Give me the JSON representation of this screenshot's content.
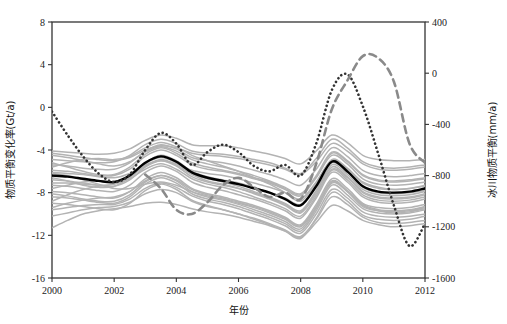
{
  "chart_data": {
    "type": "line",
    "title": "",
    "xlabel": "年份",
    "ylabel": "物质平衡变化率(Gt/a)",
    "y2label": "冰川物质平衡(mm/a)",
    "xlim": [
      2000,
      2012
    ],
    "ylim": [
      -16,
      8
    ],
    "y2lim": [
      -1600,
      400
    ],
    "xticks": [
      "2000",
      "2002",
      "2004",
      "2006",
      "2008",
      "2010",
      "2012"
    ],
    "xtick_values": [
      2000,
      2002,
      2004,
      2006,
      2008,
      2010,
      2012
    ],
    "yticks": [
      "8",
      "4",
      "0",
      "-4",
      "-8",
      "-12",
      "-16"
    ],
    "ytick_values": [
      8,
      4,
      0,
      -4,
      -8,
      -12,
      -16
    ],
    "y2ticks": [
      "400",
      "0",
      "-400",
      "-800",
      "-1200",
      "-1600"
    ],
    "y2tick_values": [
      400,
      0,
      -400,
      -800,
      -1200,
      -1600
    ],
    "grid": false,
    "legend": "none",
    "colors": {
      "ensemble_member": "#b3b3b3",
      "ensemble_mean": "#000000",
      "dotted_series": "#333333",
      "dashed_series": "#8a8a8a",
      "axis": "#333333",
      "background": "#ffffff"
    },
    "x": [
      2000,
      2000.5,
      2001,
      2001.5,
      2002,
      2002.5,
      2003,
      2003.5,
      2004,
      2004.5,
      2005,
      2005.5,
      2006,
      2006.5,
      2007,
      2007.5,
      2008,
      2008.5,
      2009,
      2009.5,
      2010,
      2010.5,
      2011,
      2011.5,
      2012
    ],
    "series": [
      {
        "name": "集合平均(黑色实线)",
        "style": "solid",
        "color": "#000000",
        "width": 2.4,
        "values": [
          -6.4,
          -6.5,
          -6.7,
          -6.9,
          -7.0,
          -6.4,
          -5.2,
          -4.6,
          -5.1,
          -6.1,
          -6.6,
          -6.9,
          -7.2,
          -7.6,
          -8.0,
          -8.6,
          -9.2,
          -7.4,
          -5.1,
          -6.0,
          -7.4,
          -7.9,
          -8.0,
          -7.9,
          -7.6
        ]
      },
      {
        "name": "点线序列(黑色点线)",
        "style": "dotted",
        "color": "#333333",
        "width": 2.0,
        "values": [
          -0.4,
          -2.6,
          -4.6,
          -6.2,
          -7.0,
          -6.3,
          -4.0,
          -2.4,
          -3.4,
          -5.4,
          -4.2,
          -3.5,
          -4.2,
          -5.5,
          -6.0,
          -5.4,
          -6.4,
          -3.4,
          1.6,
          3.1,
          0.1,
          -4.4,
          -9.2,
          -13.0,
          -10.9
        ]
      },
      {
        "name": "虚线序列(灰色虚线)",
        "style": "dashed",
        "color": "#8a8a8a",
        "width": 2.6,
        "values": [
          null,
          null,
          null,
          null,
          null,
          null,
          -6.3,
          -7.6,
          -9.6,
          -10.0,
          -8.9,
          -7.3,
          -6.6,
          -7.5,
          -8.4,
          -8.0,
          -8.6,
          -5.3,
          -0.2,
          2.5,
          4.8,
          4.6,
          2.4,
          -3.4,
          -5.2
        ]
      },
      {
        "name": "集合成员1",
        "style": "solid",
        "color": "#b3b3b3",
        "width": 1.5,
        "values": [
          -4.1,
          -4.2,
          -4.3,
          -4.4,
          -4.3,
          -3.9,
          -3.1,
          -2.6,
          -2.9,
          -3.5,
          -3.6,
          -3.6,
          -3.8,
          -4.1,
          -4.4,
          -4.8,
          -5.3,
          -4.1,
          -2.6,
          -3.3,
          -4.5,
          -4.9,
          -5.0,
          -5.0,
          -4.9
        ]
      },
      {
        "name": "集合成员2",
        "style": "solid",
        "color": "#b3b3b3",
        "width": 1.5,
        "values": [
          -4.9,
          -5.0,
          -5.1,
          -5.2,
          -5.1,
          -4.5,
          -3.5,
          -3.0,
          -3.4,
          -4.1,
          -4.3,
          -4.4,
          -4.6,
          -4.9,
          -5.2,
          -5.7,
          -6.2,
          -4.8,
          -3.0,
          -3.8,
          -5.1,
          -5.6,
          -5.7,
          -5.6,
          -5.4
        ]
      },
      {
        "name": "集合成员3",
        "style": "solid",
        "color": "#b3b3b3",
        "width": 1.5,
        "values": [
          -5.4,
          -5.5,
          -5.7,
          -5.8,
          -5.8,
          -5.2,
          -4.1,
          -3.5,
          -3.9,
          -4.7,
          -5.0,
          -5.2,
          -5.5,
          -5.9,
          -6.3,
          -6.8,
          -7.3,
          -5.8,
          -3.8,
          -4.6,
          -5.9,
          -6.4,
          -6.5,
          -6.4,
          -6.2
        ]
      },
      {
        "name": "集合成员4",
        "style": "solid",
        "color": "#b3b3b3",
        "width": 1.5,
        "values": [
          -5.9,
          -6.0,
          -6.2,
          -6.4,
          -6.4,
          -5.8,
          -4.6,
          -4.0,
          -4.5,
          -5.4,
          -5.8,
          -6.0,
          -6.3,
          -6.7,
          -7.1,
          -7.7,
          -8.3,
          -6.6,
          -4.5,
          -5.3,
          -6.7,
          -7.2,
          -7.3,
          -7.2,
          -7.0
        ]
      },
      {
        "name": "集合成员5",
        "style": "solid",
        "color": "#b3b3b3",
        "width": 1.5,
        "values": [
          -6.8,
          -6.9,
          -7.1,
          -7.3,
          -7.4,
          -6.8,
          -5.6,
          -5.0,
          -5.5,
          -6.5,
          -7.0,
          -7.3,
          -7.6,
          -8.0,
          -8.5,
          -9.1,
          -9.8,
          -7.9,
          -5.6,
          -6.5,
          -7.9,
          -8.4,
          -8.5,
          -8.4,
          -8.1
        ]
      },
      {
        "name": "集合成员6",
        "style": "solid",
        "color": "#b3b3b3",
        "width": 1.5,
        "values": [
          -7.3,
          -7.4,
          -7.6,
          -7.8,
          -7.9,
          -7.3,
          -6.1,
          -5.5,
          -6.0,
          -7.0,
          -7.5,
          -7.8,
          -8.2,
          -8.6,
          -9.1,
          -9.7,
          -10.4,
          -8.5,
          -6.1,
          -7.0,
          -8.4,
          -8.9,
          -9.0,
          -8.9,
          -8.6
        ]
      },
      {
        "name": "集合成员7",
        "style": "solid",
        "color": "#b3b3b3",
        "width": 1.5,
        "values": [
          -7.9,
          -8.0,
          -8.2,
          -8.4,
          -8.5,
          -7.9,
          -6.7,
          -6.1,
          -6.6,
          -7.6,
          -8.1,
          -8.4,
          -8.8,
          -9.2,
          -9.7,
          -10.3,
          -11.0,
          -9.1,
          -6.7,
          -7.6,
          -9.0,
          -9.4,
          -9.5,
          -9.4,
          -9.1
        ]
      },
      {
        "name": "集合成员8",
        "style": "solid",
        "color": "#b3b3b3",
        "width": 1.5,
        "values": [
          -8.4,
          -8.5,
          -8.7,
          -8.9,
          -9.0,
          -8.4,
          -7.2,
          -6.6,
          -7.1,
          -8.1,
          -8.6,
          -8.9,
          -9.3,
          -9.8,
          -10.3,
          -10.9,
          -11.6,
          -9.7,
          -7.3,
          -8.2,
          -9.5,
          -9.9,
          -10.0,
          -9.9,
          -9.6
        ]
      },
      {
        "name": "集合成员9",
        "style": "solid",
        "color": "#b3b3b3",
        "width": 1.5,
        "values": [
          -9.0,
          -9.1,
          -9.3,
          -9.5,
          -9.6,
          -9.0,
          -7.8,
          -7.2,
          -7.7,
          -8.7,
          -9.2,
          -9.6,
          -10.0,
          -10.5,
          -11.0,
          -11.6,
          -12.3,
          -10.4,
          -8.0,
          -8.8,
          -10.1,
          -10.5,
          -10.6,
          -10.5,
          -10.2
        ]
      },
      {
        "name": "集合成员10",
        "style": "solid",
        "color": "#b3b3b3",
        "width": 1.5,
        "values": [
          -11.3,
          -10.6,
          -10.0,
          -9.7,
          -9.5,
          -9.3,
          -9.0,
          -8.9,
          -9.1,
          -9.5,
          -9.8,
          -10.0,
          -10.3,
          -10.7,
          -11.1,
          -11.6,
          -12.2,
          -10.8,
          -9.2,
          -9.7,
          -10.6,
          -11.0,
          -11.2,
          -11.1,
          -10.9
        ]
      },
      {
        "name": "集合成员11",
        "style": "solid",
        "color": "#b3b3b3",
        "width": 1.5,
        "values": [
          -6.2,
          -6.4,
          -6.8,
          -7.2,
          -7.6,
          -7.6,
          -7.2,
          -7.0,
          -7.3,
          -7.9,
          -8.3,
          -8.6,
          -9.0,
          -9.4,
          -9.9,
          -10.5,
          -11.2,
          -9.4,
          -7.1,
          -7.9,
          -9.2,
          -9.7,
          -9.9,
          -9.8,
          -9.5
        ]
      },
      {
        "name": "集合成员12",
        "style": "solid",
        "color": "#b3b3b3",
        "width": 1.5,
        "values": [
          -5.6,
          -5.2,
          -4.9,
          -4.8,
          -4.9,
          -4.6,
          -3.8,
          -3.3,
          -3.7,
          -4.5,
          -5.0,
          -5.5,
          -6.0,
          -6.6,
          -7.2,
          -8.0,
          -8.8,
          -7.1,
          -4.9,
          -5.7,
          -7.0,
          -7.5,
          -7.7,
          -7.6,
          -7.3
        ]
      },
      {
        "name": "集合成员13",
        "style": "solid",
        "color": "#b3b3b3",
        "width": 1.5,
        "values": [
          -8.8,
          -8.2,
          -7.7,
          -7.4,
          -7.2,
          -6.7,
          -5.8,
          -5.3,
          -5.8,
          -6.7,
          -7.2,
          -7.5,
          -7.9,
          -8.4,
          -8.9,
          -9.5,
          -10.2,
          -8.3,
          -5.9,
          -6.8,
          -8.2,
          -8.7,
          -8.8,
          -8.7,
          -8.4
        ]
      },
      {
        "name": "集合成员14",
        "style": "solid",
        "color": "#b3b3b3",
        "width": 1.5,
        "values": [
          -6.6,
          -6.9,
          -7.3,
          -7.5,
          -7.4,
          -6.6,
          -5.3,
          -4.7,
          -5.2,
          -6.2,
          -6.7,
          -7.0,
          -7.4,
          -7.9,
          -8.4,
          -9.0,
          -9.7,
          -7.8,
          -5.4,
          -6.3,
          -7.7,
          -8.2,
          -8.3,
          -8.2,
          -7.9
        ]
      },
      {
        "name": "集合成员15",
        "style": "solid",
        "color": "#b3b3b3",
        "width": 1.5,
        "values": [
          -4.5,
          -4.7,
          -5.0,
          -5.3,
          -5.5,
          -5.1,
          -4.2,
          -3.7,
          -4.1,
          -4.9,
          -5.3,
          -5.6,
          -6.0,
          -6.4,
          -6.9,
          -7.5,
          -8.1,
          -6.5,
          -4.3,
          -5.1,
          -6.4,
          -6.9,
          -7.0,
          -6.9,
          -6.7
        ]
      },
      {
        "name": "集合成员16",
        "style": "solid",
        "color": "#b3b3b3",
        "width": 1.5,
        "values": [
          -9.6,
          -9.4,
          -9.2,
          -9.1,
          -9.1,
          -8.6,
          -7.6,
          -7.1,
          -7.5,
          -8.3,
          -8.8,
          -9.1,
          -9.5,
          -10.0,
          -10.5,
          -11.1,
          -11.8,
          -10.0,
          -7.7,
          -8.5,
          -9.8,
          -10.2,
          -10.3,
          -10.2,
          -10.0
        ]
      },
      {
        "name": "集合成员17",
        "style": "solid",
        "color": "#b3b3b3",
        "width": 1.5,
        "values": [
          -7.6,
          -7.3,
          -7.0,
          -6.9,
          -7.0,
          -6.5,
          -5.5,
          -4.9,
          -5.4,
          -6.3,
          -6.9,
          -7.2,
          -7.6,
          -8.1,
          -8.6,
          -9.2,
          -9.9,
          -8.1,
          -5.8,
          -6.6,
          -8.0,
          -8.5,
          -8.6,
          -8.5,
          -8.2
        ]
      },
      {
        "name": "集合成员18",
        "style": "solid",
        "color": "#b3b3b3",
        "width": 1.5,
        "values": [
          -5.2,
          -5.6,
          -6.0,
          -6.3,
          -6.3,
          -5.6,
          -4.4,
          -3.8,
          -4.3,
          -5.2,
          -5.6,
          -5.9,
          -6.2,
          -6.6,
          -7.0,
          -7.6,
          -8.2,
          -6.4,
          -4.2,
          -5.0,
          -6.3,
          -6.8,
          -6.9,
          -6.8,
          -6.6
        ]
      },
      {
        "name": "集合成员19",
        "style": "solid",
        "color": "#b3b3b3",
        "width": 1.5,
        "values": [
          -10.2,
          -9.9,
          -9.6,
          -9.4,
          -9.3,
          -8.9,
          -8.1,
          -7.7,
          -8.0,
          -8.8,
          -9.3,
          -9.6,
          -10.0,
          -10.4,
          -10.9,
          -11.5,
          -12.1,
          -10.5,
          -8.4,
          -9.1,
          -10.3,
          -10.8,
          -10.9,
          -10.8,
          -10.6
        ]
      },
      {
        "name": "集合成员20",
        "style": "solid",
        "color": "#b3b3b3",
        "width": 1.5,
        "values": [
          -6.1,
          -6.2,
          -6.3,
          -6.5,
          -6.6,
          -6.2,
          -5.4,
          -5.0,
          -5.3,
          -5.9,
          -6.2,
          -6.4,
          -6.7,
          -7.1,
          -7.5,
          -8.0,
          -8.6,
          -7.0,
          -5.0,
          -5.8,
          -7.1,
          -7.6,
          -7.7,
          -7.6,
          -7.4
        ]
      },
      {
        "name": "集合成员21",
        "style": "solid",
        "color": "#b3b3b3",
        "width": 1.5,
        "values": [
          -7.1,
          -7.1,
          -7.2,
          -7.3,
          -7.2,
          -6.5,
          -5.2,
          -4.5,
          -5.0,
          -6.0,
          -6.5,
          -6.8,
          -7.1,
          -7.5,
          -8.0,
          -8.5,
          -9.1,
          -7.3,
          -5.2,
          -6.1,
          -7.5,
          -8.0,
          -8.1,
          -8.0,
          -7.8
        ]
      },
      {
        "name": "集合成员22",
        "style": "solid",
        "color": "#b3b3b3",
        "width": 1.5,
        "values": [
          -8.1,
          -8.3,
          -8.6,
          -8.8,
          -8.8,
          -8.2,
          -7.0,
          -6.4,
          -6.9,
          -7.9,
          -8.4,
          -8.7,
          -9.1,
          -9.6,
          -10.1,
          -10.7,
          -11.4,
          -9.5,
          -7.0,
          -7.9,
          -9.3,
          -9.7,
          -9.8,
          -9.7,
          -9.4
        ]
      },
      {
        "name": "集合成员23",
        "style": "solid",
        "color": "#b3b3b3",
        "width": 1.5,
        "values": [
          -4.3,
          -4.5,
          -4.7,
          -4.9,
          -5.0,
          -4.7,
          -4.0,
          -3.6,
          -3.8,
          -4.3,
          -4.5,
          -4.6,
          -4.8,
          -5.1,
          -5.4,
          -5.8,
          -6.3,
          -5.1,
          -3.4,
          -4.1,
          -5.3,
          -5.8,
          -5.9,
          -5.8,
          -5.6
        ]
      },
      {
        "name": "集合成员24",
        "style": "solid",
        "color": "#b3b3b3",
        "width": 1.5,
        "values": [
          -9.4,
          -9.0,
          -8.7,
          -8.5,
          -8.4,
          -7.9,
          -6.9,
          -6.4,
          -6.8,
          -7.7,
          -8.2,
          -8.5,
          -8.9,
          -9.3,
          -9.8,
          -10.4,
          -11.1,
          -9.3,
          -6.9,
          -7.8,
          -9.1,
          -9.6,
          -9.7,
          -9.6,
          -9.3
        ]
      }
    ]
  },
  "axes": {
    "left_title": "物质平衡变化率(Gt/a)",
    "right_title": "冰川物质平衡(mm/a)",
    "bottom_title": "年份"
  }
}
